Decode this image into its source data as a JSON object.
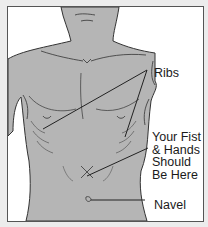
{
  "diagram": {
    "title": "",
    "colors": {
      "background": "#ececec",
      "panel": "#ffffff",
      "skin": "#b5b5b5",
      "outline": "#333333",
      "text": "#1a1a1a"
    },
    "labels": {
      "ribs": "Ribs",
      "fist_line1": "Your Fist",
      "fist_line2": "& Hands",
      "fist_line3": "Should",
      "fist_line4": "Be Here",
      "navel": "Navel"
    }
  }
}
